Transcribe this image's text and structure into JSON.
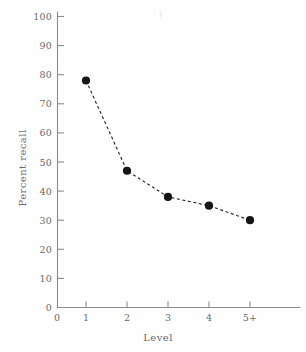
{
  "figure": {
    "background_color": "#fefefe",
    "ink_color": "#6b6b6b",
    "marker_color": "#161616",
    "axis_color": "#8d8d8d"
  },
  "artifact": {
    "speck_glyph": "("
  },
  "chart_data": {
    "type": "line",
    "title": "",
    "subtitle": "",
    "xlabel": "Level",
    "ylabel": "Percent recall",
    "categories": [
      "1",
      "2",
      "3",
      "4",
      "5+"
    ],
    "x_tick_labels": [
      "0",
      "1",
      "2",
      "3",
      "4",
      "5+"
    ],
    "y_tick_labels": [
      "0",
      "10",
      "20",
      "30",
      "40",
      "50",
      "60",
      "70",
      "80",
      "90",
      "100"
    ],
    "y_ticks": [
      0,
      10,
      20,
      30,
      40,
      50,
      60,
      70,
      80,
      90,
      100
    ],
    "values": [
      78,
      47,
      38,
      35,
      30
    ],
    "series": [
      {
        "name": "Percent recall",
        "values": [
          78,
          47,
          38,
          35,
          30
        ],
        "line_style": "dashed",
        "marker": "filled-circle",
        "color": "#161616"
      }
    ],
    "ylim": [
      0,
      100
    ],
    "grid": false,
    "legend": false,
    "legend_position": "none",
    "annotations": []
  }
}
